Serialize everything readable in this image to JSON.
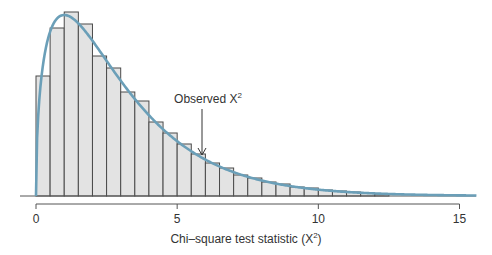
{
  "chart_data": {
    "type": "bar",
    "subtype": "histogram-with-density-curve",
    "title": "",
    "xlabel": "Chi–square test statistic (X²)",
    "xlabel_main": "Chi–square test statistic (X",
    "xlabel_sup": "2",
    "xlabel_end": ")",
    "ylabel": "",
    "xlim": [
      0,
      15.5
    ],
    "x_ticks": [
      0,
      5,
      10,
      15
    ],
    "x_tick_labels": [
      "0",
      "5",
      "10",
      "15"
    ],
    "bin_width": 0.5,
    "bin_starts": [
      0,
      0.5,
      1,
      1.5,
      2,
      2.5,
      3,
      3.5,
      4,
      4.5,
      5,
      5.5,
      6,
      6.5,
      7,
      7.5,
      8,
      8.5,
      9,
      9.5,
      10,
      10.5,
      11,
      11.5,
      12
    ],
    "values_relative_height": [
      120,
      168,
      184,
      172,
      140,
      128,
      104,
      95,
      74,
      63,
      52,
      42,
      33,
      28,
      21,
      18,
      14,
      12,
      9,
      8,
      6,
      5,
      4,
      3,
      2
    ],
    "curve": {
      "description": "Chi-square density curve overlaid on histogram",
      "color": "#6b9fb8",
      "x_end": 15.6
    },
    "bar_fill": "#e3e3e3",
    "bar_stroke": "#4a4a4a",
    "grid": false,
    "legend": null,
    "annotations": [
      {
        "text": "Observed X²",
        "text_main": "Observed X",
        "sup": "2",
        "arrow_to_x": 5.8
      }
    ]
  }
}
